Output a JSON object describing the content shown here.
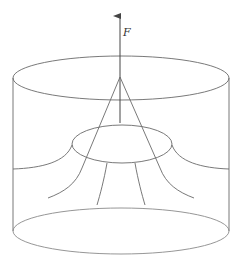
{
  "diagram": {
    "force_label": "F",
    "colors": {
      "line": "#6a6a6a",
      "arrow": "#444444",
      "background": "#ffffff"
    },
    "elements": [
      "outer-cylinder",
      "top-ellipse",
      "bottom-ellipse",
      "force-arrow",
      "cone-lines",
      "inner-ellipse",
      "field-lines"
    ]
  }
}
